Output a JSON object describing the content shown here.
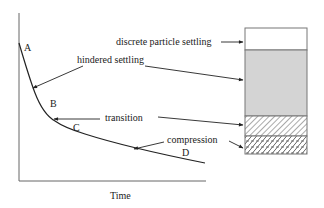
{
  "diagram": {
    "x_axis_label": "Time",
    "y_axis_label": "",
    "curve_points": {
      "A": "A",
      "B": "B",
      "C": "C",
      "D": "D"
    },
    "zones": [
      {
        "label": "discrete particle settling",
        "fill": "#ffffff",
        "pattern": "none"
      },
      {
        "label": "hindered settling",
        "fill": "#d4d4d4",
        "pattern": "solid-gray"
      },
      {
        "label": "transition",
        "fill": "#ffffff",
        "pattern": "diagonal-hatch"
      },
      {
        "label": "compression",
        "fill": "#ffffff",
        "pattern": "brick-crosshatch"
      }
    ],
    "colors": {
      "line": "#333333",
      "gray_zone": "#d4d4d4",
      "border": "#777777"
    }
  }
}
